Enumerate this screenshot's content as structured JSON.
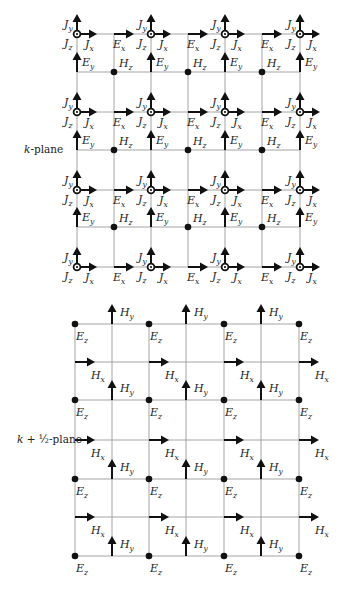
{
  "k_plane": {
    "label_k": "k",
    "label_rest": "-plane",
    "rows": 4,
    "cols": 4,
    "symbols": {
      "current_y": {
        "base": "J",
        "sub": "y"
      },
      "current_z": {
        "base": "J",
        "sub": "z"
      },
      "current_x": {
        "base": "J",
        "sub": "x"
      },
      "e_x": {
        "base": "E",
        "sub": "x"
      },
      "e_y": {
        "base": "E",
        "sub": "y"
      },
      "h_z": {
        "base": "H",
        "sub": "z"
      }
    },
    "node_icon": "current-out-of-plane-icon",
    "field_point_icon": "filled-dot-icon"
  },
  "half_plane": {
    "label_k": "k",
    "label_rest": " + ½-plane",
    "rows": 4,
    "cols": 4,
    "symbols": {
      "e_z": {
        "base": "E",
        "sub": "z"
      },
      "h_x": {
        "base": "H",
        "sub": "x"
      },
      "h_y": {
        "base": "H",
        "sub": "y"
      }
    },
    "field_point_icon": "filled-dot-icon"
  },
  "colors": {
    "grid": "#9a9a9a",
    "ink": "#111111",
    "text": "#222222"
  }
}
